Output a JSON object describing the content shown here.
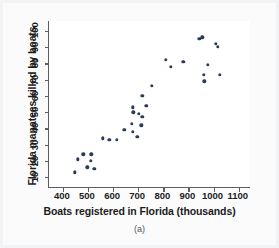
{
  "figure": {
    "caption": "(a)",
    "background_color": "#f2f3f5",
    "plot_background_color": "#ffffff",
    "axis_color": "#5a5f66",
    "marker_color": "#2b3a56"
  },
  "chart_data": {
    "type": "scatter",
    "title": "",
    "xlabel": "Boats registered in Florida (thousands)",
    "ylabel": "Florida manatees killed by boats",
    "xlim": [
      345,
      1145
    ],
    "ylim": [
      4,
      106
    ],
    "xticks": [
      400,
      500,
      600,
      700,
      800,
      900,
      1000,
      1100
    ],
    "xticklabels": [
      "400",
      "500",
      "600",
      "700",
      "800",
      "900",
      "1000",
      "1100"
    ],
    "yticks": [
      10,
      20,
      30,
      40,
      50,
      60,
      70,
      80,
      90,
      100
    ],
    "yticklabels": [
      "10",
      "20",
      "30",
      "40",
      "50",
      "60",
      "70",
      "80",
      "90",
      "100"
    ],
    "grid": false,
    "legend": null,
    "points": [
      {
        "x": 447,
        "y": 13
      },
      {
        "x": 460,
        "y": 21
      },
      {
        "x": 481,
        "y": 24
      },
      {
        "x": 498,
        "y": 16
      },
      {
        "x": 513,
        "y": 24
      },
      {
        "x": 512,
        "y": 20
      },
      {
        "x": 526,
        "y": 15
      },
      {
        "x": 559,
        "y": 34
      },
      {
        "x": 585,
        "y": 33
      },
      {
        "x": 614,
        "y": 33
      },
      {
        "x": 645,
        "y": 39
      },
      {
        "x": 675,
        "y": 43
      },
      {
        "x": 681,
        "y": 50
      },
      {
        "x": 679,
        "y": 53
      },
      {
        "x": 678,
        "y": 38
      },
      {
        "x": 696,
        "y": 35
      },
      {
        "x": 702,
        "y": 49
      },
      {
        "x": 712,
        "y": 42
      },
      {
        "x": 716,
        "y": 47
      },
      {
        "x": 716,
        "y": 60
      },
      {
        "x": 732,
        "y": 54
      },
      {
        "x": 755,
        "y": 66
      },
      {
        "x": 809,
        "y": 82
      },
      {
        "x": 830,
        "y": 78
      },
      {
        "x": 880,
        "y": 81
      },
      {
        "x": 944,
        "y": 95
      },
      {
        "x": 962,
        "y": 73
      },
      {
        "x": 963,
        "y": 69
      },
      {
        "x": 955,
        "y": 96
      },
      {
        "x": 978,
        "y": 79
      },
      {
        "x": 1010,
        "y": 92
      },
      {
        "x": 1024,
        "y": 73
      },
      {
        "x": 1017,
        "y": 90
      }
    ]
  }
}
